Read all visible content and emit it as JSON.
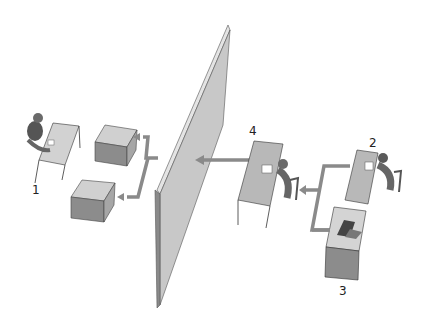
{
  "diagram": {
    "labels": {
      "one": "1",
      "two": "2",
      "three": "3",
      "four": "4"
    },
    "colors": {
      "wall_face": "#c8c8c8",
      "wall_edge": "#9a9a9a",
      "arrow": "#8a8a8a",
      "box_top": "#cfcfcf",
      "box_front": "#8c8c8c",
      "box_side": "#a8a8a8",
      "desk": "#b8b8b8",
      "person": "#6a6a6a"
    }
  }
}
